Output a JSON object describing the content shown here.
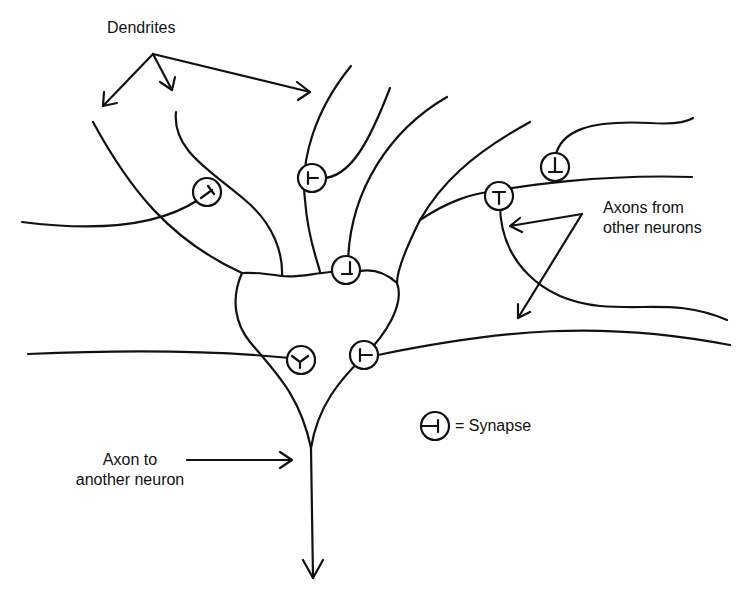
{
  "diagram": {
    "labels": {
      "dendrites": "Dendrites",
      "axons_from_line1": "Axons from",
      "axons_from_line2": "other neurons",
      "synapse_legend": "= Synapse",
      "axon_to_line1": "Axon to",
      "axon_to_line2": "another neuron"
    },
    "nodes": [
      {
        "id": "cell-body",
        "label": "Cell body (soma)"
      },
      {
        "id": "dendrites",
        "label": "Dendrites"
      },
      {
        "id": "axon-out",
        "label": "Axon to another neuron"
      },
      {
        "id": "axons-in",
        "label": "Axons from other neurons"
      }
    ],
    "synapse_count": 7,
    "colors": {
      "line": "#111111",
      "background": "#ffffff"
    }
  }
}
